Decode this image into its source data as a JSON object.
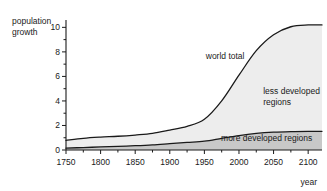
{
  "chart_data": {
    "type": "area",
    "title": "",
    "subtitle": "",
    "xlabel": "year",
    "ylabel": "population growth",
    "ylabel_line1": "population",
    "ylabel_line2": "growth",
    "stacked": true,
    "grid": false,
    "legend_position": "inline-annotations",
    "xlim": [
      1750,
      2120
    ],
    "ylim": [
      0,
      10.6
    ],
    "x_ticks": [
      1750,
      1800,
      1850,
      1900,
      1950,
      2000,
      2050,
      2100
    ],
    "x_tick_labels": [
      "1750",
      "1800",
      "1850",
      "1900",
      "1950",
      "2000",
      "2050",
      "2100"
    ],
    "x_minor_step": 25,
    "y_ticks": [
      0,
      2,
      4,
      6,
      8,
      10
    ],
    "y_tick_labels": [
      "0",
      "2",
      "4",
      "6",
      "8",
      "10"
    ],
    "y_minor_step": 1,
    "x": [
      1750,
      1775,
      1800,
      1825,
      1850,
      1875,
      1900,
      1925,
      1950,
      1975,
      2000,
      2025,
      2050,
      2075,
      2100,
      2120
    ],
    "series": [
      {
        "name": "more developed regions",
        "label": "more developed regions",
        "fill_color": "#c8c8c8",
        "line_color": "#1a1a1a",
        "values": [
          0.15,
          0.2,
          0.25,
          0.3,
          0.35,
          0.42,
          0.52,
          0.62,
          0.72,
          0.95,
          1.18,
          1.35,
          1.45,
          1.5,
          1.52,
          1.52
        ]
      },
      {
        "name": "less developed regions",
        "label": "less developed regions",
        "label_line1": "less developed",
        "label_line2": "regions",
        "fill_color": "#ededed",
        "line_color": "#1a1a1a",
        "values": [
          0.63,
          0.75,
          0.8,
          0.82,
          0.87,
          0.93,
          1.1,
          1.3,
          1.78,
          3.05,
          4.92,
          6.75,
          7.95,
          8.55,
          8.68,
          8.68
        ]
      }
    ],
    "total_series": {
      "name": "world total",
      "label": "world total",
      "line_color": "#1a1a1a",
      "values": [
        0.78,
        0.95,
        1.05,
        1.12,
        1.22,
        1.35,
        1.62,
        1.92,
        2.5,
        4.0,
        6.1,
        8.1,
        9.4,
        10.05,
        10.2,
        10.2
      ]
    },
    "annotations": [
      {
        "text": "world total",
        "x": 1980,
        "y": 7.4
      },
      {
        "text": "less developed regions",
        "x": 2035,
        "y": 4.6
      },
      {
        "text": "more developed regions",
        "x": 2040,
        "y": 0.75
      }
    ]
  }
}
